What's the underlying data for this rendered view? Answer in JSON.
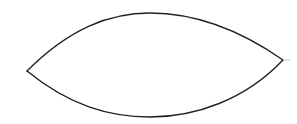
{
  "diagram": {
    "shape": "lens",
    "stroke_color": "#222222",
    "tail_color": "#d0d0d0",
    "background": "#ffffff",
    "stroke_width": 1.4,
    "left_tip": [
      27,
      71
    ],
    "right_tip": [
      283,
      60
    ],
    "top_apex_y": 13,
    "bottom_apex_y": 117,
    "tail_end": [
      291,
      60
    ]
  }
}
